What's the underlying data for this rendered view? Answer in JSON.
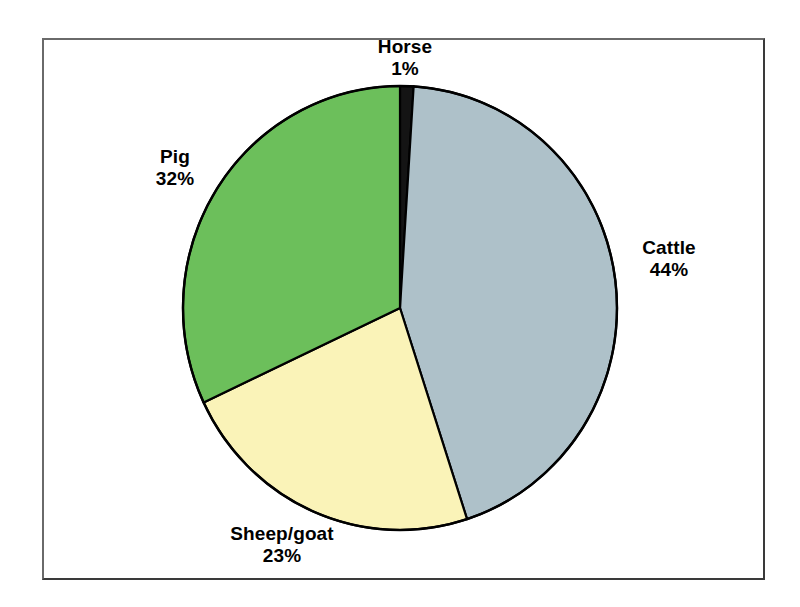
{
  "figure": {
    "background_color": "#ffffff",
    "frame_color": "#3a3a3a",
    "outline_color": "#000000"
  },
  "chart_data": {
    "type": "pie",
    "title": "",
    "subtitle": "",
    "xlabel": "",
    "ylabel": "",
    "legend_position": "none",
    "grid": false,
    "labels_position": "outside",
    "start_angle_deg": 0,
    "direction": "clockwise",
    "categories": [
      "Horse",
      "Cattle",
      "Sheep/goat",
      "Pig"
    ],
    "values": [
      1,
      44,
      23,
      32
    ],
    "value_unit": "%",
    "colors": [
      "#141414",
      "#aec1c9",
      "#faf3b8",
      "#6cbf5b"
    ],
    "slices": [
      {
        "label": "Horse",
        "value": 1,
        "value_text": "1%",
        "color": "#141414",
        "start_deg": 0,
        "end_deg": 3.6
      },
      {
        "label": "Cattle",
        "value": 44,
        "value_text": "44%",
        "color": "#aec1c9",
        "start_deg": 3.6,
        "end_deg": 162.0
      },
      {
        "label": "Sheep/goat",
        "value": 23,
        "value_text": "23%",
        "color": "#faf3b8",
        "start_deg": 162.0,
        "end_deg": 244.8
      },
      {
        "label": "Pig",
        "value": 32,
        "value_text": "32%",
        "color": "#6cbf5b",
        "start_deg": 244.8,
        "end_deg": 360.0
      }
    ]
  },
  "labels": {
    "horse": {
      "name": "Horse",
      "value": "1%"
    },
    "cattle": {
      "name": "Cattle",
      "value": "44%"
    },
    "pig": {
      "name": "Pig",
      "value": "32%"
    },
    "sheep_goat": {
      "name": "Sheep/goat",
      "value": "23%"
    }
  }
}
